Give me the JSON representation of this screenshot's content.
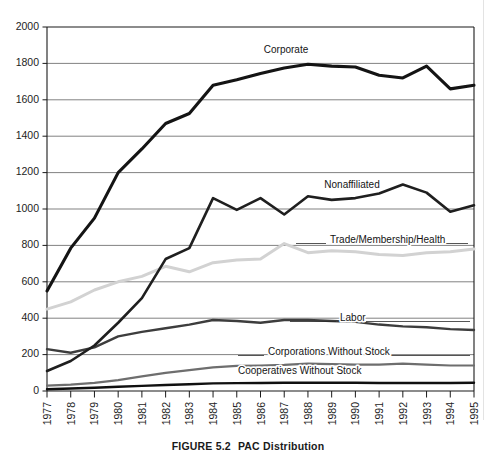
{
  "caption": {
    "figure_number": "FIGURE 5.2",
    "figure_title": "PAC Distribution"
  },
  "axes": {
    "y_ticks": [
      "2000",
      "1800",
      "1600",
      "1400",
      "1200",
      "1000",
      "800",
      "600",
      "400",
      "200",
      "0"
    ],
    "x_ticks": [
      "1977",
      "1978",
      "1979",
      "1980",
      "1981",
      "1982",
      "1983",
      "1984",
      "1985",
      "1986",
      "1987",
      "1988",
      "1989",
      "1990",
      "1991",
      "1992",
      "1993",
      "1994",
      "1995"
    ]
  },
  "series_labels": {
    "corporate": "Corporate",
    "nonaffiliated": "Nonaffiliated",
    "trade": "Trade/Membership/Health",
    "labor": "Labor",
    "corporations_without_stock": "Corporations Without Stock",
    "cooperatives_without_stock": "Cooperatives Without Stock"
  },
  "colors": {
    "corporate": "#141414",
    "nonaffiliated": "#1f1f1f",
    "trade": "#d2d2d2",
    "labor": "#3d3d3d",
    "corporations_without_stock": "#6e6e6e",
    "cooperatives_without_stock": "#101010",
    "gridline": "#6b6b6b",
    "axis": "#1a1a1a"
  },
  "chart_data": {
    "type": "line",
    "title": "PAC Distribution",
    "xlabel": "",
    "ylabel": "",
    "xlim": [
      1977,
      1995
    ],
    "ylim": [
      0,
      2000
    ],
    "y_tick_step": 200,
    "grid": true,
    "legend_position": "inline-labels",
    "x": [
      1977,
      1978,
      1979,
      1980,
      1981,
      1982,
      1983,
      1984,
      1985,
      1986,
      1987,
      1988,
      1989,
      1990,
      1991,
      1992,
      1993,
      1994,
      1995
    ],
    "series": [
      {
        "name": "Corporate",
        "values": [
          550,
          785,
          950,
          1200,
          1330,
          1470,
          1525,
          1680,
          1710,
          1745,
          1775,
          1795,
          1785,
          1780,
          1735,
          1720,
          1785,
          1660,
          1680
        ]
      },
      {
        "name": "Nonaffiliated",
        "values": [
          110,
          165,
          250,
          375,
          510,
          725,
          785,
          1060,
          995,
          1060,
          970,
          1070,
          1050,
          1060,
          1085,
          1135,
          1090,
          985,
          1020
        ]
      },
      {
        "name": "Trade/Membership/Health",
        "values": [
          450,
          490,
          555,
          600,
          630,
          685,
          655,
          705,
          720,
          725,
          810,
          760,
          770,
          765,
          750,
          745,
          760,
          765,
          780
        ]
      },
      {
        "name": "Labor",
        "values": [
          230,
          210,
          240,
          300,
          325,
          345,
          365,
          390,
          385,
          375,
          390,
          390,
          385,
          380,
          365,
          355,
          350,
          340,
          335
        ]
      },
      {
        "name": "Corporations Without Stock",
        "values": [
          30,
          35,
          45,
          60,
          80,
          100,
          115,
          130,
          138,
          140,
          143,
          150,
          148,
          145,
          145,
          150,
          145,
          140,
          140
        ]
      },
      {
        "name": "Cooperatives Without Stock",
        "values": [
          10,
          14,
          18,
          23,
          28,
          33,
          37,
          42,
          43,
          44,
          45,
          45,
          45,
          45,
          44,
          44,
          44,
          44,
          45
        ]
      }
    ]
  }
}
